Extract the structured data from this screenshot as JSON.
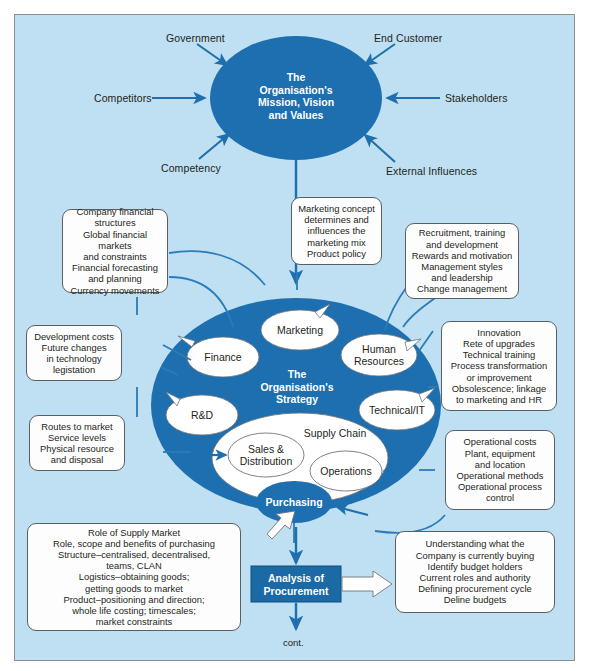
{
  "colors": {
    "background": "#bfe0f2",
    "deep_blue": "#1d6fb0",
    "dark_blue": "#1b6aa5",
    "arrow_blue": "#1f6fae",
    "line_blue": "#2b7cb8",
    "box_fill": "#fdfdfd",
    "text_dark": "#231f20",
    "frame_border": "#8a8f94"
  },
  "center_top": {
    "title_lines": [
      "The",
      "Organisation's",
      "Mission, Vision",
      "and Values"
    ]
  },
  "top_inputs": [
    {
      "label": "Government"
    },
    {
      "label": "End Customer"
    },
    {
      "label": "Competitors"
    },
    {
      "label": "Stakeholders"
    },
    {
      "label": "Competency"
    },
    {
      "label": "External Influences"
    }
  ],
  "center_strategy": {
    "title_lines": [
      "The",
      "Organisation's",
      "Strategy"
    ],
    "functions": [
      {
        "label": "Marketing"
      },
      {
        "label": "Finance"
      },
      {
        "label": "Human\nResources"
      },
      {
        "label": "R&D"
      },
      {
        "label": "Technical/IT"
      }
    ],
    "supply_chain": {
      "label": "Supply Chain",
      "members": [
        {
          "label": "Sales &\nDistribution"
        },
        {
          "label": "Operations"
        },
        {
          "label": "Purchasing"
        }
      ]
    }
  },
  "callouts": [
    {
      "name": "finance-callout",
      "lines": [
        "Company financial",
        "structures",
        "Global financial markets",
        "and constraints",
        "Financial forecasting",
        "and planning",
        "Currency movements"
      ]
    },
    {
      "name": "rd-callout",
      "lines": [
        "Development costs",
        "Future changes",
        "in technology",
        "legistation"
      ]
    },
    {
      "name": "distribution-callout",
      "lines": [
        "Routes to market",
        "Service levels",
        "Physical resource",
        "and disposal"
      ]
    },
    {
      "name": "marketing-callout",
      "lines": [
        "Marketing concept",
        "determines and",
        "influences the",
        "marketing mix",
        "Product policy"
      ]
    },
    {
      "name": "hr-callout",
      "lines": [
        "Recruitment, training",
        "and development",
        "Rewards and motivation",
        "Management styles",
        "and leadership",
        "Change management"
      ]
    },
    {
      "name": "technical-callout",
      "lines": [
        "Innovation",
        "Rete of upgrades",
        "Technical training",
        "Process transformation",
        "or improvement",
        "Obsolescence; linkage",
        "to marketing and HR"
      ]
    },
    {
      "name": "operations-callout",
      "lines": [
        "Operational costs",
        "Plant, equipment",
        "and location",
        "Operational methods",
        "Operational process",
        "control"
      ]
    },
    {
      "name": "purchasing-callout",
      "lines": [
        "Role of Supply Market",
        "Role, scope and benefits of purchasing",
        "Structure–centralised, decentralised,",
        "teams, CLAN",
        "Logistics–obtaining goods;",
        "getting goods to market",
        "Product–positioning and direction;",
        "whole life costing; timescales;",
        "market constraints"
      ]
    },
    {
      "name": "procurement-analysis-callout",
      "lines": [
        "Understanding what the",
        "Company is currently buying",
        "Identify budget holders",
        "Current roles and authority",
        "Defining procurement cycle",
        "Deline budgets"
      ]
    }
  ],
  "analysis_box": {
    "title_lines": [
      "Analysis of",
      "Procurement"
    ]
  },
  "footer": {
    "cont_label": "cont."
  }
}
